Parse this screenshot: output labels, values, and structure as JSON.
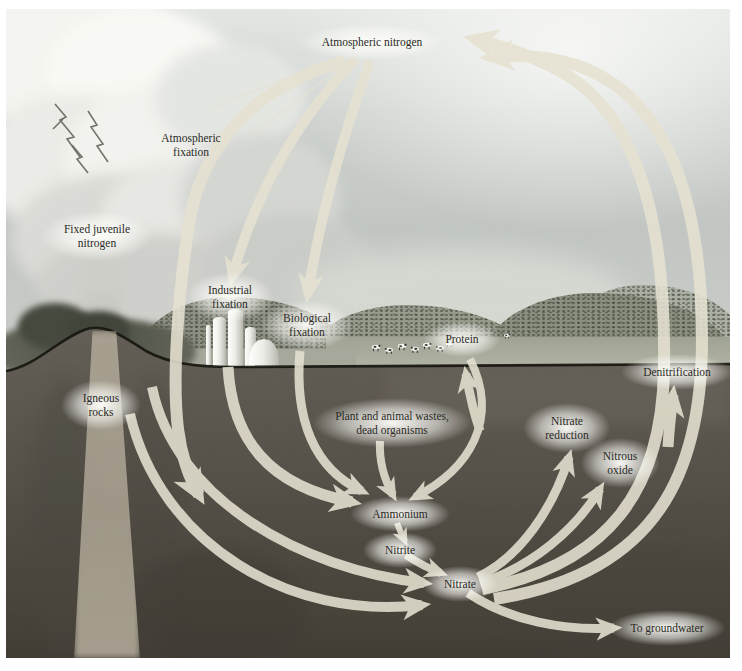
{
  "figure": {
    "type": "nitrogen-cycle-diagram",
    "labels": {
      "atmospheric_nitrogen": {
        "text": "Atmospheric nitrogen"
      },
      "atmospheric_fixation": {
        "line1": "Atmospheric",
        "line2": "fixation"
      },
      "fixed_juvenile_nitrogen": {
        "line1": "Fixed juvenile",
        "line2": "nitrogen"
      },
      "industrial_fixation": {
        "line1": "Industrial",
        "line2": "fixation"
      },
      "biological_fixation": {
        "line1": "Biological",
        "line2": "fixation"
      },
      "protein": {
        "text": "Protein"
      },
      "igneous_rocks": {
        "line1": "Igneous",
        "line2": "rocks"
      },
      "wastes": {
        "line1": "Plant and animal wastes,",
        "line2": "dead organisms"
      },
      "ammonium": {
        "text": "Ammonium"
      },
      "nitrite": {
        "text": "Nitrite"
      },
      "nitrate": {
        "text": "Nitrate"
      },
      "nitrate_reduction": {
        "line1": "Nitrate",
        "line2": "reduction"
      },
      "nitrous_oxide": {
        "line1": "Nitrous",
        "line2": "oxide"
      },
      "denitrification": {
        "text": "Denitrification"
      },
      "to_groundwater": {
        "text": "To groundwater"
      }
    },
    "flows": [
      {
        "from": "Atmospheric nitrogen",
        "to": "Atmospheric fixation (soil)"
      },
      {
        "from": "Atmospheric nitrogen",
        "to": "Industrial fixation"
      },
      {
        "from": "Atmospheric nitrogen",
        "to": "Biological fixation"
      },
      {
        "from": "Industrial fixation",
        "to": "Ammonium"
      },
      {
        "from": "Biological fixation",
        "to": "Ammonium"
      },
      {
        "from": "Plant and animal wastes, dead organisms",
        "to": "Ammonium"
      },
      {
        "from": "Protein",
        "to": "Ammonium"
      },
      {
        "from": "Soil nitrogen",
        "to": "Protein"
      },
      {
        "from": "Ammonium",
        "to": "Nitrite"
      },
      {
        "from": "Nitrite",
        "to": "Nitrate"
      },
      {
        "from": "Nitrate",
        "to": "Nitrate reduction"
      },
      {
        "from": "Nitrate",
        "to": "Nitrous oxide"
      },
      {
        "from": "Nitrate",
        "to": "Denitrification"
      },
      {
        "from": "Denitrification",
        "to": "Atmospheric nitrogen"
      },
      {
        "from": "Nitrate",
        "to": "To groundwater"
      }
    ],
    "colors": {
      "arrow": "#e6e2d2",
      "ground_line": "#17170f",
      "label_text": "#2b2b26",
      "soil": "#7d7669",
      "sky": "#c8ccc7"
    }
  }
}
